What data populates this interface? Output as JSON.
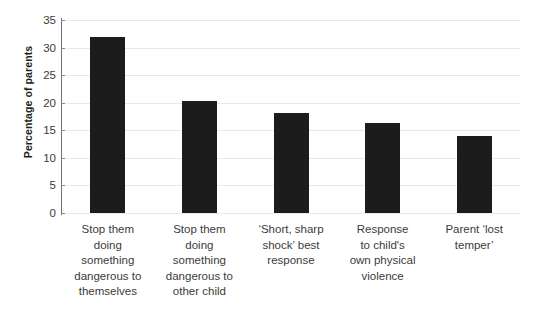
{
  "chart_data": {
    "type": "bar",
    "title": "",
    "xlabel": "",
    "ylabel": "Percentage of parents",
    "ylim": [
      0,
      35
    ],
    "ytick_step": 5,
    "yticks": [
      0,
      5,
      10,
      15,
      20,
      25,
      30,
      35
    ],
    "grid": true,
    "legend": "none",
    "bar_color": "#1c1c1c",
    "categories": [
      "Stop them doing something dangerous to themselves",
      "Stop them doing something dangerous to other child",
      "‘Short, sharp shock’ best response",
      "Response to child's own physical violence",
      "Parent ‘lost temper’"
    ],
    "category_lines": [
      [
        "Stop them",
        "doing",
        "something",
        "dangerous to",
        "themselves"
      ],
      [
        "Stop them",
        "doing",
        "something",
        "dangerous to",
        "other child"
      ],
      [
        "‘Short, sharp",
        "shock’ best",
        "response"
      ],
      [
        "Response",
        "to child's",
        "own physical",
        "violence"
      ],
      [
        "Parent ‘lost",
        "temper’"
      ]
    ],
    "values": [
      32.0,
      20.3,
      18.2,
      16.3,
      14.0
    ]
  }
}
